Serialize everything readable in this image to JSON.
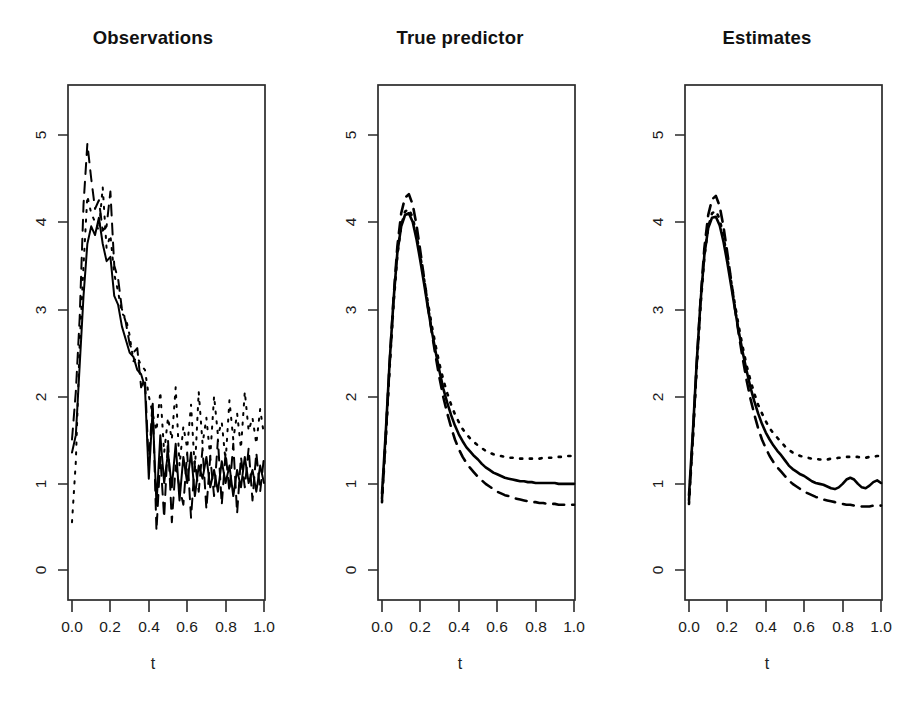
{
  "figure": {
    "background": "#ffffff",
    "ink_color": "#000000",
    "panel_count": 3
  },
  "chart_data": [
    {
      "type": "line",
      "title": "Observations",
      "xlabel": "t",
      "ylabel": "",
      "xlim": [
        0.0,
        1.0
      ],
      "ylim": [
        -0.35,
        5.6
      ],
      "xticks": [
        "0.0",
        "0.2",
        "0.4",
        "0.6",
        "0.8",
        "1.0"
      ],
      "xtick_values": [
        0.0,
        0.2,
        0.4,
        0.6,
        0.8,
        1.0
      ],
      "yticks": [
        "0",
        "1",
        "2",
        "3",
        "4",
        "5"
      ],
      "ytick_values": [
        0,
        1,
        2,
        3,
        4,
        5
      ],
      "grid": false,
      "legend": "none",
      "note": "Noisy sampled observations of three subjects; heavy measurement noise increases after t=0.45",
      "x": [
        0.0,
        0.02,
        0.04,
        0.06,
        0.08,
        0.1,
        0.12,
        0.14,
        0.16,
        0.18,
        0.2,
        0.22,
        0.24,
        0.26,
        0.28,
        0.3,
        0.32,
        0.34,
        0.36,
        0.38,
        0.4,
        0.42,
        0.44,
        0.46,
        0.48,
        0.5,
        0.52,
        0.54,
        0.56,
        0.58,
        0.6,
        0.62,
        0.64,
        0.66,
        0.68,
        0.7,
        0.72,
        0.74,
        0.76,
        0.78,
        0.8,
        0.82,
        0.84,
        0.86,
        0.88,
        0.9,
        0.92,
        0.94,
        0.96,
        0.98,
        1.0
      ],
      "series": [
        {
          "name": "subject-1",
          "linetype": "solid",
          "values": [
            1.35,
            1.55,
            2.35,
            3.15,
            3.75,
            3.95,
            3.85,
            4.05,
            3.75,
            3.55,
            3.6,
            3.15,
            3.05,
            2.8,
            2.65,
            2.5,
            2.45,
            2.3,
            2.25,
            2.1,
            1.05,
            1.85,
            0.75,
            1.55,
            1.0,
            1.35,
            0.95,
            1.45,
            0.8,
            1.3,
            1.0,
            1.35,
            0.85,
            1.2,
            1.05,
            1.3,
            0.95,
            1.15,
            0.9,
            1.25,
            1.0,
            1.2,
            0.85,
            1.15,
            0.95,
            1.3,
            1.0,
            1.15,
            0.9,
            1.2,
            1.0
          ]
        },
        {
          "name": "subject-2",
          "linetype": "dashed",
          "values": [
            1.5,
            2.05,
            2.9,
            4.2,
            4.9,
            4.5,
            4.15,
            4.25,
            3.9,
            3.95,
            4.35,
            3.5,
            3.35,
            3.0,
            2.85,
            2.6,
            2.5,
            2.55,
            2.1,
            2.2,
            1.2,
            1.95,
            0.45,
            1.3,
            0.6,
            1.5,
            0.55,
            1.2,
            0.95,
            0.75,
            1.35,
            0.6,
            1.25,
            0.9,
            1.4,
            0.7,
            1.3,
            0.85,
            1.5,
            0.75,
            1.35,
            0.9,
            1.45,
            0.65,
            1.3,
            0.95,
            1.4,
            0.8,
            1.35,
            0.9,
            1.3
          ]
        },
        {
          "name": "subject-3",
          "linetype": "dotted",
          "values": [
            0.55,
            1.25,
            2.6,
            3.5,
            4.3,
            4.1,
            4.0,
            3.9,
            4.4,
            3.7,
            3.85,
            3.4,
            3.2,
            2.95,
            2.9,
            2.7,
            2.4,
            2.45,
            2.35,
            2.3,
            2.0,
            1.8,
            1.6,
            2.05,
            1.35,
            1.75,
            1.5,
            2.1,
            1.2,
            1.65,
            1.4,
            1.9,
            1.15,
            2.05,
            1.45,
            1.75,
            1.3,
            2.0,
            1.55,
            1.7,
            1.25,
            1.95,
            1.5,
            1.8,
            1.4,
            2.05,
            1.6,
            1.75,
            1.45,
            1.85,
            1.55
          ]
        }
      ]
    },
    {
      "type": "line",
      "title": "True predictor",
      "xlabel": "t",
      "ylabel": "",
      "xlim": [
        0.0,
        1.0
      ],
      "ylim": [
        -0.35,
        5.6
      ],
      "xticks": [
        "0.0",
        "0.2",
        "0.4",
        "0.6",
        "0.8",
        "1.0"
      ],
      "xtick_values": [
        0.0,
        0.2,
        0.4,
        0.6,
        0.8,
        1.0
      ],
      "yticks": [
        "0",
        "1",
        "2",
        "3",
        "4",
        "5"
      ],
      "ytick_values": [
        0,
        1,
        2,
        3,
        4,
        5
      ],
      "grid": false,
      "legend": "none",
      "note": "Smooth true underlying predictor curves: sharp rise to a peak near t=0.14 then decay to separated plateaus",
      "x": [
        0.0,
        0.02,
        0.04,
        0.06,
        0.08,
        0.1,
        0.12,
        0.14,
        0.16,
        0.18,
        0.2,
        0.22,
        0.24,
        0.26,
        0.28,
        0.3,
        0.32,
        0.34,
        0.36,
        0.38,
        0.4,
        0.42,
        0.44,
        0.46,
        0.48,
        0.5,
        0.52,
        0.54,
        0.56,
        0.58,
        0.6,
        0.62,
        0.64,
        0.66,
        0.68,
        0.7,
        0.72,
        0.74,
        0.76,
        0.78,
        0.8,
        0.82,
        0.84,
        0.86,
        0.88,
        0.9,
        0.92,
        0.94,
        0.96,
        0.98,
        1.0
      ],
      "series": [
        {
          "name": "subject-1",
          "linetype": "solid",
          "values": [
            0.88,
            1.6,
            2.4,
            3.1,
            3.65,
            3.95,
            4.08,
            4.1,
            4.0,
            3.8,
            3.55,
            3.28,
            3.0,
            2.74,
            2.5,
            2.28,
            2.08,
            1.92,
            1.78,
            1.66,
            1.56,
            1.48,
            1.41,
            1.36,
            1.31,
            1.27,
            1.22,
            1.18,
            1.15,
            1.12,
            1.1,
            1.08,
            1.06,
            1.05,
            1.04,
            1.03,
            1.02,
            1.02,
            1.01,
            1.01,
            1.0,
            1.0,
            1.0,
            1.0,
            1.0,
            1.0,
            0.99,
            0.99,
            0.99,
            0.99,
            0.99
          ]
        },
        {
          "name": "subject-2",
          "linetype": "dashed",
          "values": [
            0.82,
            1.55,
            2.38,
            3.12,
            3.72,
            4.1,
            4.28,
            4.32,
            4.2,
            3.96,
            3.66,
            3.34,
            3.02,
            2.72,
            2.45,
            2.2,
            1.98,
            1.8,
            1.64,
            1.5,
            1.39,
            1.3,
            1.23,
            1.17,
            1.12,
            1.07,
            1.03,
            0.99,
            0.96,
            0.93,
            0.9,
            0.88,
            0.86,
            0.85,
            0.83,
            0.82,
            0.81,
            0.8,
            0.79,
            0.78,
            0.78,
            0.77,
            0.77,
            0.76,
            0.76,
            0.76,
            0.75,
            0.75,
            0.75,
            0.75,
            0.75
          ]
        },
        {
          "name": "subject-3",
          "linetype": "dotted",
          "values": [
            0.78,
            1.52,
            2.34,
            3.05,
            3.62,
            3.96,
            4.12,
            4.15,
            4.05,
            3.85,
            3.6,
            3.33,
            3.06,
            2.8,
            2.57,
            2.36,
            2.18,
            2.03,
            1.9,
            1.79,
            1.7,
            1.62,
            1.56,
            1.51,
            1.47,
            1.43,
            1.4,
            1.37,
            1.35,
            1.33,
            1.32,
            1.31,
            1.3,
            1.29,
            1.29,
            1.28,
            1.28,
            1.28,
            1.28,
            1.28,
            1.28,
            1.28,
            1.29,
            1.29,
            1.29,
            1.3,
            1.3,
            1.3,
            1.31,
            1.31,
            1.31
          ]
        }
      ]
    },
    {
      "type": "line",
      "title": "Estimates",
      "xlabel": "t",
      "ylabel": "",
      "xlim": [
        0.0,
        1.0
      ],
      "ylim": [
        -0.35,
        5.6
      ],
      "xticks": [
        "0.0",
        "0.2",
        "0.4",
        "0.6",
        "0.8",
        "1.0"
      ],
      "xtick_values": [
        0.0,
        0.2,
        0.4,
        0.6,
        0.8,
        1.0
      ],
      "yticks": [
        "0",
        "1",
        "2",
        "3",
        "4",
        "5"
      ],
      "ytick_values": [
        0,
        1,
        2,
        3,
        4,
        5
      ],
      "grid": false,
      "legend": "none",
      "note": "Estimated predictor curves recovered from the noisy observations; shape matches the truth with mild wiggle in the tail",
      "x": [
        0.0,
        0.02,
        0.04,
        0.06,
        0.08,
        0.1,
        0.12,
        0.14,
        0.16,
        0.18,
        0.2,
        0.22,
        0.24,
        0.26,
        0.28,
        0.3,
        0.32,
        0.34,
        0.36,
        0.38,
        0.4,
        0.42,
        0.44,
        0.46,
        0.48,
        0.5,
        0.52,
        0.54,
        0.56,
        0.58,
        0.6,
        0.62,
        0.64,
        0.66,
        0.68,
        0.7,
        0.72,
        0.74,
        0.76,
        0.78,
        0.8,
        0.82,
        0.84,
        0.86,
        0.88,
        0.9,
        0.92,
        0.94,
        0.96,
        0.98,
        1.0
      ],
      "series": [
        {
          "name": "subject-1",
          "linetype": "solid",
          "values": [
            0.86,
            1.58,
            2.38,
            3.08,
            3.62,
            3.93,
            4.05,
            4.06,
            3.96,
            3.77,
            3.53,
            3.26,
            2.99,
            2.73,
            2.5,
            2.29,
            2.1,
            1.94,
            1.8,
            1.68,
            1.58,
            1.5,
            1.43,
            1.37,
            1.32,
            1.26,
            1.2,
            1.16,
            1.13,
            1.1,
            1.08,
            1.05,
            1.02,
            1.0,
            0.99,
            0.98,
            0.96,
            0.94,
            0.93,
            0.95,
            0.99,
            1.04,
            1.06,
            1.04,
            0.99,
            0.95,
            0.94,
            0.97,
            1.01,
            1.03,
            1.0
          ]
        },
        {
          "name": "subject-2",
          "linetype": "dashed",
          "values": [
            0.8,
            1.53,
            2.36,
            3.1,
            3.7,
            4.08,
            4.26,
            4.3,
            4.18,
            3.94,
            3.64,
            3.32,
            3.0,
            2.7,
            2.43,
            2.18,
            1.97,
            1.79,
            1.63,
            1.5,
            1.4,
            1.31,
            1.24,
            1.18,
            1.13,
            1.08,
            1.03,
            0.99,
            0.96,
            0.93,
            0.9,
            0.88,
            0.86,
            0.84,
            0.83,
            0.81,
            0.8,
            0.79,
            0.78,
            0.77,
            0.76,
            0.75,
            0.75,
            0.74,
            0.74,
            0.73,
            0.73,
            0.73,
            0.74,
            0.74,
            0.74
          ]
        },
        {
          "name": "subject-3",
          "linetype": "dotted",
          "values": [
            0.76,
            1.5,
            2.32,
            3.03,
            3.6,
            3.94,
            4.1,
            4.13,
            4.03,
            3.83,
            3.58,
            3.31,
            3.04,
            2.79,
            2.56,
            2.35,
            2.18,
            2.03,
            1.9,
            1.8,
            1.71,
            1.63,
            1.57,
            1.52,
            1.47,
            1.42,
            1.38,
            1.35,
            1.33,
            1.31,
            1.3,
            1.29,
            1.28,
            1.28,
            1.27,
            1.27,
            1.27,
            1.28,
            1.28,
            1.29,
            1.29,
            1.3,
            1.3,
            1.3,
            1.3,
            1.29,
            1.29,
            1.3,
            1.3,
            1.31,
            1.31
          ]
        }
      ]
    }
  ]
}
